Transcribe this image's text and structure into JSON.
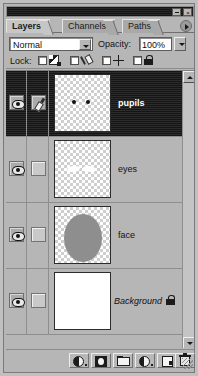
{
  "window": {
    "title": "",
    "minimize_label": "_",
    "close_label": "×"
  },
  "tabs": [
    {
      "label": "Layers",
      "active": true
    },
    {
      "label": "Channels",
      "active": false
    },
    {
      "label": "Paths",
      "active": false
    }
  ],
  "palette_menu_icon": "palette-menu-icon",
  "blend": {
    "mode_value": "Normal",
    "opacity_label": "Opacity:",
    "opacity_value": "100%"
  },
  "lock": {
    "label": "Lock:",
    "items": [
      {
        "name": "lock-transparent-pixels",
        "icon": "transparency-icon",
        "checked": false
      },
      {
        "name": "lock-image-pixels",
        "icon": "brush-icon",
        "checked": false
      },
      {
        "name": "lock-position",
        "icon": "move-cross-icon",
        "checked": false
      },
      {
        "name": "lock-all",
        "icon": "padlock-icon",
        "checked": false
      }
    ]
  },
  "layers": [
    {
      "name": "pupils",
      "visible": true,
      "active_brush": true,
      "selected": true,
      "locked": false,
      "italic": false,
      "thumb": "pupils"
    },
    {
      "name": "eyes",
      "visible": true,
      "active_brush": false,
      "selected": false,
      "locked": false,
      "italic": false,
      "thumb": "eyes"
    },
    {
      "name": "face",
      "visible": true,
      "active_brush": false,
      "selected": false,
      "locked": false,
      "italic": false,
      "thumb": "face"
    },
    {
      "name": "Background",
      "visible": true,
      "active_brush": false,
      "selected": false,
      "locked": true,
      "italic": true,
      "thumb": "white"
    }
  ],
  "scrollbar": {
    "up_icon": "scroll-up-arrow-icon",
    "down_icon": "scroll-down-arrow-icon"
  },
  "bottom_toolbar": [
    {
      "name": "add-layer-style-button",
      "icon": "layer-style-icon"
    },
    {
      "name": "add-layer-mask-button",
      "icon": "layer-mask-icon"
    },
    {
      "name": "new-layer-set-button",
      "icon": "folder-icon"
    },
    {
      "name": "new-adjustment-layer-button",
      "icon": "adjustment-layer-icon"
    },
    {
      "name": "new-layer-button",
      "icon": "new-page-icon"
    },
    {
      "name": "delete-layer-button",
      "icon": "trash-icon"
    }
  ],
  "colors": {
    "panel_bg": "#b6b6b6",
    "selection_bg": "#1d1d1d",
    "selection_text": "#ffffff",
    "thumb_face_fill": "#8e8e8e",
    "pupil_fill": "#111111"
  }
}
